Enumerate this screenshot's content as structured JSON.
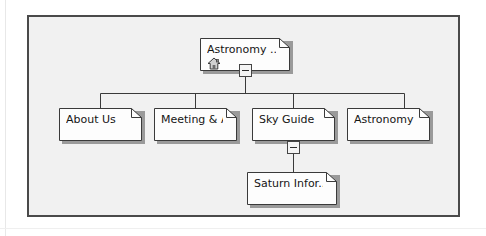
{
  "diagram": {
    "type": "sitemap-tree",
    "panel": {
      "background_color": "#f1f1f1",
      "border_color": "#4a4a4a"
    },
    "node_style": {
      "fill_color": "#fdfdfd",
      "border_color": "#3a3a3a",
      "shadow_color": "#9a9a9a",
      "fold_corner": true
    },
    "connector_color": "#3a3a3a",
    "nodes": [
      {
        "id": "root",
        "label": "Astronomy ...",
        "level": 0,
        "icon": "home-icon",
        "toggle": "minus",
        "x": 198,
        "y": 36,
        "w": 90,
        "h": 33
      },
      {
        "id": "about-us",
        "label": "About Us",
        "level": 1,
        "toggle": null,
        "x": 57,
        "y": 106,
        "w": 83,
        "h": 33
      },
      {
        "id": "meeting",
        "label": "Meeting & A...",
        "level": 1,
        "toggle": null,
        "x": 152,
        "y": 106,
        "w": 83,
        "h": 33
      },
      {
        "id": "sky-guide",
        "label": "Sky Guide",
        "level": 1,
        "toggle": "minus",
        "x": 250,
        "y": 106,
        "w": 83,
        "h": 33
      },
      {
        "id": "astronomy-sub",
        "label": "Astronomy ...",
        "level": 1,
        "toggle": null,
        "x": 345,
        "y": 106,
        "w": 83,
        "h": 33
      },
      {
        "id": "saturn",
        "label": "Saturn Infor...",
        "level": 2,
        "toggle": null,
        "x": 245,
        "y": 170,
        "w": 90,
        "h": 33
      }
    ],
    "edges": [
      {
        "from": "root",
        "to": "about-us"
      },
      {
        "from": "root",
        "to": "meeting"
      },
      {
        "from": "root",
        "to": "sky-guide"
      },
      {
        "from": "root",
        "to": "astronomy-sub"
      },
      {
        "from": "sky-guide",
        "to": "saturn"
      }
    ]
  }
}
